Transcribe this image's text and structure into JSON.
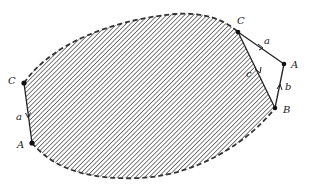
{
  "diagram": {
    "colors": {
      "stroke": "#222222",
      "hatch": "#555555",
      "background": "#ffffff"
    },
    "left": {
      "top_vertex": "C",
      "bottom_vertex": "A",
      "edge_label": "a"
    },
    "right": {
      "vertex_c": "C",
      "vertex_a": "A",
      "vertex_b": "B",
      "edge_ca_label": "a",
      "edge_ba_label": "b",
      "edge_cb_label": "c"
    }
  }
}
